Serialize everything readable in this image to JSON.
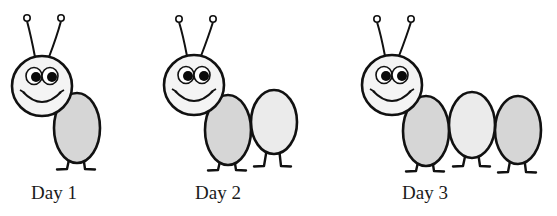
{
  "colors": {
    "outline": "#111111",
    "head_fill": "#f4f4f4",
    "body_fill_dark": "#d6d6d6",
    "body_fill_light": "#ebebeb",
    "pupil": "#0a0a0a",
    "background": "#ffffff"
  },
  "figures": [
    {
      "label": "Day 1",
      "label_x": 31,
      "head": {
        "cx": 42,
        "cy": 86,
        "r": 30
      },
      "antenna_tips": [
        [
          27,
          18
        ],
        [
          61,
          18
        ]
      ],
      "segments": [
        {
          "cx": 77,
          "cy": 128,
          "rx": 23,
          "ry": 35,
          "shade": "dark",
          "legs": [
            [
              70,
              67,
              57
            ],
            [
              83,
              85,
              95
            ]
          ],
          "leg_top": 155,
          "leg_bottom": 169
        }
      ]
    },
    {
      "label": "Day 2",
      "label_x": 195,
      "head": {
        "cx": 194,
        "cy": 85,
        "r": 30
      },
      "antenna_tips": [
        [
          179,
          19
        ],
        [
          213,
          19
        ]
      ],
      "segments": [
        {
          "cx": 228,
          "cy": 130,
          "rx": 23,
          "ry": 35,
          "shade": "dark",
          "legs": [
            [
              221,
              218,
              208
            ],
            [
              234,
              236,
              246
            ]
          ],
          "leg_top": 157,
          "leg_bottom": 170
        },
        {
          "cx": 274,
          "cy": 122,
          "rx": 23,
          "ry": 32,
          "shade": "light",
          "legs": [
            [
              267,
              264,
              254
            ],
            [
              279,
              281,
              291
            ]
          ],
          "leg_top": 148,
          "leg_bottom": 166
        }
      ]
    },
    {
      "label": "Day 3",
      "label_x": 402,
      "head": {
        "cx": 392,
        "cy": 85,
        "r": 30
      },
      "antenna_tips": [
        [
          377,
          19
        ],
        [
          411,
          19
        ]
      ],
      "segments": [
        {
          "cx": 426,
          "cy": 131,
          "rx": 23,
          "ry": 35,
          "shade": "dark",
          "legs": [
            [
              419,
              416,
              406
            ],
            [
              432,
              434,
              444
            ]
          ],
          "leg_top": 158,
          "leg_bottom": 171
        },
        {
          "cx": 472,
          "cy": 125,
          "rx": 23,
          "ry": 33,
          "shade": "light",
          "legs": [
            [
              466,
              463,
              453
            ],
            [
              478,
              480,
              490
            ]
          ],
          "leg_top": 152,
          "leg_bottom": 166
        },
        {
          "cx": 518,
          "cy": 130,
          "rx": 23,
          "ry": 34,
          "shade": "dark",
          "legs": [
            [
              511,
              508,
              498
            ],
            [
              524,
              526,
              536
            ]
          ],
          "leg_top": 156,
          "leg_bottom": 172
        }
      ]
    }
  ]
}
